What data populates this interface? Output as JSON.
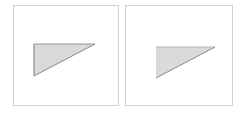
{
  "panels": [
    {
      "id": "left",
      "shape": "right-triangle",
      "fill": "#d9d9d9",
      "stroke": "#8c8c8c",
      "outline_edges": [
        "left",
        "top",
        "hypotenuse"
      ],
      "points": [
        [
          34,
          44
        ],
        [
          95,
          44
        ],
        [
          34,
          76
        ]
      ]
    },
    {
      "id": "right",
      "shape": "right-triangle",
      "fill": "#dadada",
      "stroke": "#8c8c8c",
      "outline_edges": [
        "top-light",
        "hypotenuse"
      ],
      "points": [
        [
          156,
          47
        ],
        [
          215,
          47
        ],
        [
          156,
          78
        ]
      ]
    }
  ]
}
